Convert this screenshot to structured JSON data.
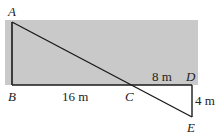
{
  "diagram": {
    "points": {
      "A": {
        "label": "A",
        "x": 12,
        "y": 22
      },
      "B": {
        "label": "B",
        "x": 12,
        "y": 85
      },
      "C": {
        "label": "C",
        "x": 128,
        "y": 85
      },
      "D": {
        "label": "D",
        "x": 192,
        "y": 85
      },
      "E": {
        "label": "E",
        "x": 192,
        "y": 117
      }
    },
    "measurements": {
      "BC": "16 m",
      "CD": "8 m",
      "DE": "4 m"
    },
    "colors": {
      "shaded_region": "#c8c8c8",
      "lines": "#1a1a1a"
    }
  }
}
